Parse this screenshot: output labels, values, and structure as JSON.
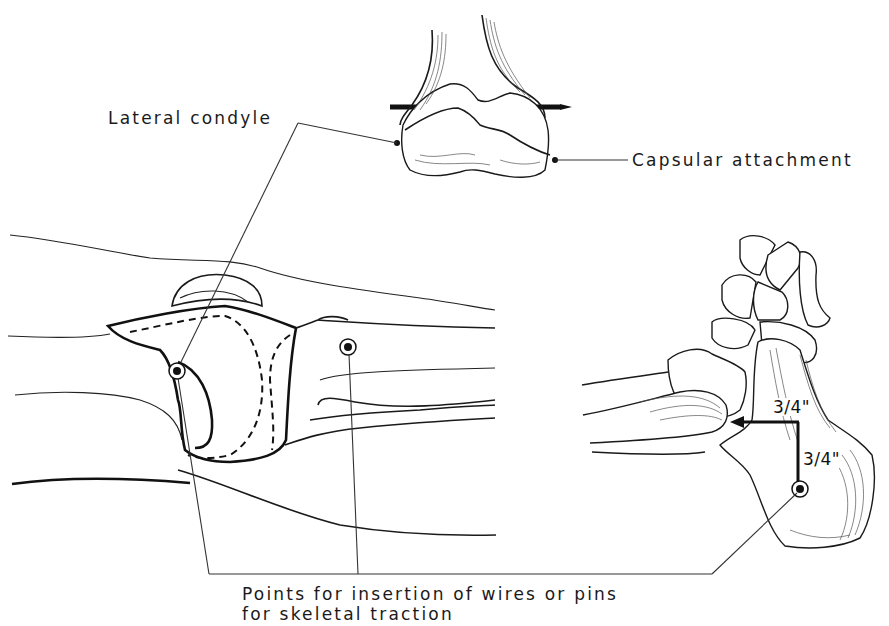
{
  "figure": {
    "labels": {
      "lateral_condyle": "Lateral condyle",
      "capsular_attachment": "Capsular attachment",
      "insertion_points_line1": "Points for insertion of wires or pins",
      "insertion_points_line2": "for skeletal traction"
    },
    "measurements": {
      "horizontal_distance": "3/4\"",
      "vertical_distance": "3/4\""
    },
    "views": [
      {
        "name": "distal-femur-anterior-view",
        "markers": [
          "lateral-condyle-point",
          "capsular-attachment-point"
        ]
      },
      {
        "name": "knee-lateral-view",
        "markers": [
          "femoral-condyle-pin-site",
          "tibial-tubercle-pin-site"
        ]
      },
      {
        "name": "foot-ankle-lateral-view",
        "markers": [
          "calcaneus-pin-site"
        ]
      }
    ],
    "colors": {
      "ink": "#111111",
      "background": "#ffffff"
    }
  }
}
